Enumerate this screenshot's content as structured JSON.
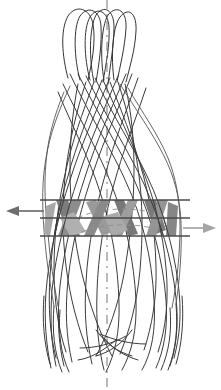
{
  "figure": {
    "title": "Braided stent radial compression diagram",
    "background_color": "#ffffff",
    "width": 221,
    "height": 390
  },
  "colors": {
    "wire_stroke": "#3b3b3b",
    "wire_stroke_light": "#555555",
    "cell_fill_dark": "#7d7d7d",
    "cell_fill_mid": "#999999",
    "cell_fill_light": "#b4b4b4",
    "section_line": "#4a4a4a",
    "centerline": "#8d8d8d",
    "arrow_left": "#6e6e6e",
    "arrow_right": "#a5a5a5"
  },
  "centerline": {
    "label": "axis-of-symmetry",
    "x": 107,
    "y_top": 0,
    "y_bottom": 390,
    "style": "dash-dot"
  },
  "arrows": {
    "left": {
      "label": "radial-force-left",
      "direction": "left",
      "color": "#6e6e6e",
      "tip_x": 8,
      "tail_x": 44,
      "y": 211
    },
    "right": {
      "label": "radial-force-right",
      "direction": "right",
      "color": "#a5a5a5",
      "tip_x": 214,
      "tail_x": 183,
      "y": 228
    }
  },
  "section_lines": [
    {
      "label": "section-line-upper",
      "y": 200,
      "x_start": 40,
      "x_end": 190
    },
    {
      "label": "section-line-middle",
      "y": 218,
      "x_start": 40,
      "x_end": 190
    },
    {
      "label": "section-line-lower",
      "y": 236,
      "x_start": 40,
      "x_end": 190
    }
  ],
  "stent": {
    "label": "braided-stent-body",
    "crown_count": 5,
    "wire_count": 18,
    "crown_top_y": 8,
    "crown_bottom_y": 62,
    "crown_left_x": 64,
    "crown_right_x": 130,
    "neck_y": 70,
    "neck_left_x": 70,
    "neck_right_x": 126,
    "flare_start_y": 120,
    "body_bottom_y": 340,
    "body_left_x": 45,
    "body_right_x": 180,
    "free_end_y": 372
  },
  "highlight_band": {
    "label": "compression-band",
    "top_y": 200,
    "bottom_y": 236,
    "cell_count": 10
  },
  "chart_data": {
    "type": "diagram",
    "title": "Braided stent radial compression diagram",
    "elements": [
      "crown-loops",
      "braided-wires",
      "compression-band",
      "section-lines",
      "radial-force-arrows",
      "axis-centerline"
    ]
  }
}
